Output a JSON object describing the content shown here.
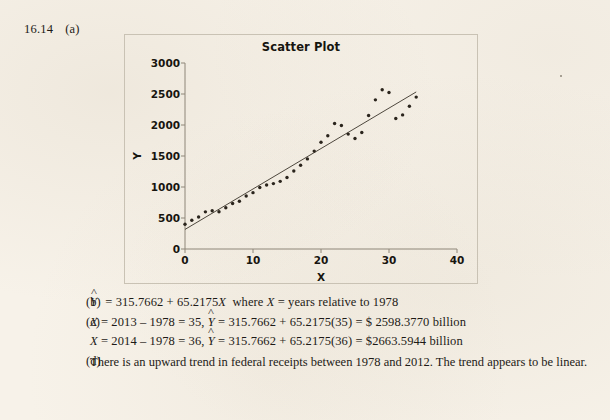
{
  "problem": {
    "number": "16.14",
    "part_a_label": "(a)",
    "part_b_label": "(b)",
    "part_c_label": "(c)",
    "part_d_label": "(d)"
  },
  "chart": {
    "title": "Scatter Plot",
    "xlabel": "X",
    "ylabel": "Y"
  },
  "solution": {
    "b_equation": "= 315.7662 + 65.2175",
    "b_yhat": "Y",
    "b_varX": "X",
    "b_where": "where",
    "b_whereX": "X",
    "b_note": "= years relative to 1978",
    "c_line1_lhs": "X",
    "c_line1_calc": "= 2013 – 1978 = 35,",
    "c_line1_yhat": "Y",
    "c_line1_rhs": "= 315.7662 + 65.2175(35) = $ 2598.3770 billion",
    "c_line2_lhs": "X",
    "c_line2_calc": "= 2014 – 1978 = 36,",
    "c_line2_yhat": "Y",
    "c_line2_rhs": "= 315.7662 + 65.2175(36) = $2663.5944 billion",
    "d_text": "There is an upward trend in federal receipts between 1978 and 2012.  The trend appears to be linear."
  },
  "chart_data": {
    "type": "scatter",
    "title": "Scatter Plot",
    "xlabel": "X",
    "ylabel": "Y",
    "xlim": [
      0,
      40
    ],
    "ylim": [
      0,
      3000
    ],
    "xticks": [
      0,
      10,
      20,
      30,
      40
    ],
    "yticks": [
      0,
      500,
      1000,
      1500,
      2000,
      2500,
      3000
    ],
    "grid": false,
    "legend": false,
    "marker_color": "#2a241c",
    "trendline": {
      "label": "Y = 315.7662 + 65.2175X",
      "intercept": 315.7662,
      "slope": 65.2175,
      "x_start": 0,
      "x_end": 34,
      "color": "#3b342a"
    },
    "x": [
      0,
      1,
      2,
      3,
      4,
      5,
      6,
      7,
      8,
      9,
      10,
      11,
      12,
      13,
      14,
      15,
      16,
      17,
      18,
      19,
      20,
      21,
      22,
      23,
      24,
      25,
      26,
      27,
      28,
      29,
      30,
      31,
      32,
      33,
      34
    ],
    "y": [
      399,
      463,
      517,
      599,
      618,
      601,
      666,
      734,
      769,
      854,
      909,
      991,
      1032,
      1055,
      1091,
      1154,
      1258,
      1351,
      1453,
      1579,
      1721,
      1827,
      2025,
      1991,
      1853,
      1782,
      1880,
      2153,
      2406,
      2568,
      2524,
      2105,
      2163,
      2303,
      2450
    ]
  }
}
